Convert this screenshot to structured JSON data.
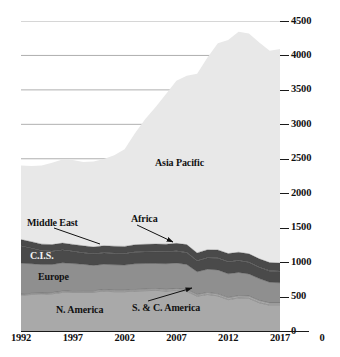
{
  "chart_data": {
    "type": "area",
    "stacked": true,
    "title": "",
    "xlabel": "",
    "ylabel": "Coal annual consumption (million toe)",
    "xlim": [
      1992,
      2017
    ],
    "ylim": [
      0,
      4500
    ],
    "grid": true,
    "grid_values": [
      2500,
      3000,
      3500,
      4000,
      4500
    ],
    "legend_position": "inline-labels",
    "y_ticks": [
      0,
      500,
      1000,
      1500,
      2000,
      2500,
      3000,
      3500,
      4000,
      4500
    ],
    "y_tick_labels": [
      "0",
      "500",
      "1000",
      "1500",
      "2000",
      "2500",
      "3000",
      "3500",
      "4000",
      "4500"
    ],
    "x_ticks": [
      1992,
      1997,
      2002,
      2007,
      2012,
      2017
    ],
    "x_tick_labels": [
      "1992",
      "1997",
      "2002",
      "2007",
      "2012",
      "2017"
    ],
    "x": [
      1992,
      1993,
      1994,
      1995,
      1996,
      1997,
      1998,
      1999,
      2000,
      2001,
      2002,
      2003,
      2004,
      2005,
      2006,
      2007,
      2008,
      2009,
      2010,
      2011,
      2012,
      2013,
      2014,
      2015,
      2016,
      2017
    ],
    "series": [
      {
        "name": "N. America",
        "color": "#a9a9a9",
        "values": [
          520,
          530,
          535,
          540,
          560,
          565,
          565,
          565,
          580,
          570,
          570,
          580,
          585,
          590,
          580,
          590,
          575,
          505,
          530,
          510,
          455,
          480,
          475,
          410,
          375,
          375
        ]
      },
      {
        "name": "S. & C. America",
        "color": "#a9a9a9",
        "values": [
          16,
          16,
          17,
          17,
          18,
          18,
          19,
          19,
          20,
          21,
          21,
          22,
          23,
          23,
          24,
          25,
          26,
          25,
          28,
          29,
          30,
          32,
          33,
          33,
          33,
          33
        ]
      },
      {
        "name": "Europe",
        "color": "#8f8f8f",
        "values": [
          448,
          430,
          412,
          408,
          412,
          396,
          384,
          368,
          368,
          370,
          366,
          374,
          372,
          368,
          372,
          372,
          364,
          330,
          338,
          348,
          345,
          338,
          320,
          318,
          300,
          292
        ]
      },
      {
        "name": "C.I.S.",
        "color": "#4a4a4a",
        "values": [
          250,
          225,
          200,
          190,
          185,
          175,
          165,
          165,
          165,
          165,
          165,
          168,
          168,
          168,
          170,
          168,
          170,
          155,
          162,
          168,
          170,
          168,
          165,
          160,
          160,
          162
        ]
      },
      {
        "name": "Middle East",
        "color": "#4a4a4a",
        "values": [
          5,
          5,
          6,
          6,
          6,
          7,
          7,
          7,
          8,
          8,
          8,
          8,
          9,
          9,
          9,
          9,
          9,
          9,
          9,
          9,
          9,
          9,
          9,
          9,
          9,
          9
        ]
      },
      {
        "name": "Africa",
        "color": "#4a4a4a",
        "values": [
          88,
          90,
          91,
          93,
          95,
          96,
          97,
          96,
          97,
          97,
          98,
          100,
          102,
          104,
          105,
          108,
          110,
          110,
          112,
          113,
          115,
          116,
          118,
          118,
          116,
          116
        ]
      },
      {
        "name": "Asia Pacific",
        "color": "#e8e8e8",
        "values": [
          1075,
          1100,
          1140,
          1190,
          1215,
          1225,
          1215,
          1240,
          1260,
          1320,
          1410,
          1620,
          1820,
          1990,
          2180,
          2360,
          2450,
          2600,
          2790,
          3000,
          3100,
          3200,
          3200,
          3140,
          3075,
          3105
        ]
      }
    ],
    "annotations": [
      {
        "label": "Asia Pacific",
        "kind": "inline"
      },
      {
        "label": "Middle East",
        "kind": "leader-line"
      },
      {
        "label": "Africa",
        "kind": "arrow"
      },
      {
        "label": "C.I.S.",
        "kind": "inline"
      },
      {
        "label": "Europe",
        "kind": "inline"
      },
      {
        "label": "N. America",
        "kind": "inline"
      },
      {
        "label": "S. & C. America",
        "kind": "arrow"
      }
    ]
  },
  "axis": {
    "y_title": "Coal annual consumption (million toe)"
  },
  "labels": {
    "asia_pacific": "Asia Pacific",
    "middle_east": "Middle East",
    "africa": "Africa",
    "cis": "C.I.S.",
    "europe": "Europe",
    "n_america": "N. America",
    "sc_america": "S. & C. America"
  },
  "colors": {
    "asia_pacific": "#e8e8e8",
    "dark_band": "#4a4a4a",
    "europe": "#8f8f8f",
    "n_america": "#a9a9a9",
    "axis": "#1a1a1a",
    "grid": "#9a9a9a",
    "background": "#ffffff"
  }
}
